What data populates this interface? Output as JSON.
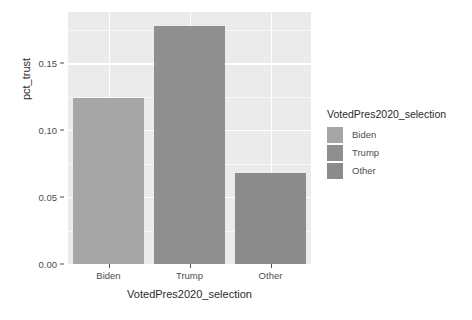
{
  "chart_data": {
    "type": "bar",
    "title": "",
    "subtitle": "",
    "xlabel": "VotedPres2020_selection",
    "ylabel": "pct_trust",
    "categories": [
      "Biden",
      "Trump",
      "Other"
    ],
    "values": [
      0.124,
      0.178,
      0.068
    ],
    "series": [
      {
        "name": "pct_trust",
        "values": [
          0.124,
          0.178,
          0.068
        ]
      }
    ],
    "ylim": [
      0.0,
      0.1885
    ],
    "xlim_categories": [
      "Biden",
      "Trump",
      "Other"
    ],
    "y_ticks": [
      "0.00",
      "0.05",
      "0.10",
      "0.15"
    ],
    "y_tick_values": [
      0.0,
      0.05,
      0.1,
      0.15
    ],
    "y_minor_tick_values": [
      0.025,
      0.075,
      0.125,
      0.175
    ],
    "x_ticks": [
      "Biden",
      "Trump",
      "Other"
    ],
    "grid": true,
    "legend": {
      "title": "VotedPres2020_selection",
      "position": "right",
      "entries": [
        {
          "label": "Biden",
          "color": "#a6a6a6"
        },
        {
          "label": "Trump",
          "color": "#8f8f8f"
        },
        {
          "label": "Other",
          "color": "#8b8b8b"
        }
      ]
    },
    "bar_colors": [
      "#a6a6a6",
      "#8f8f8f",
      "#8b8b8b"
    ],
    "panel_background": "#ebebeb",
    "grid_color": "#ffffff",
    "text_color": "#4d4d4d",
    "plot_background": "#ffffff"
  }
}
